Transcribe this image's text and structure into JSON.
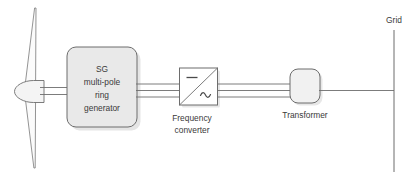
{
  "diagram": {
    "colors": {
      "stroke": "#6d6d6d",
      "box_fill": "#e9e9e9",
      "box_fill_light": "#f1f1f1",
      "text": "#3a3a3a",
      "background": "#ffffff",
      "blade_fill": "#fbfbfb",
      "shadow": "#c8c8c8"
    },
    "components": {
      "turbine": {
        "name": "wind-turbine",
        "blade_upper": "blade",
        "blade_lower": "blade",
        "hub": "nose-cone"
      },
      "generator": {
        "name": "generator-block",
        "lines": [
          "SG",
          "multi-pole",
          "ring",
          "generator"
        ]
      },
      "converter": {
        "name": "frequency-converter-block",
        "caption_lines": [
          "Frequency",
          "converter"
        ],
        "dc_symbol": "—",
        "ac_symbol": "∿"
      },
      "transformer": {
        "name": "transformer-block",
        "caption": "Transformer"
      },
      "grid": {
        "name": "grid-bus",
        "label": "Grid"
      }
    },
    "connections": {
      "shaft": "mechanical-shaft",
      "gen_to_conv": "three-phase-bus",
      "conv_to_xfmr": "three-phase-bus",
      "xfmr_to_grid": "single-line"
    }
  }
}
